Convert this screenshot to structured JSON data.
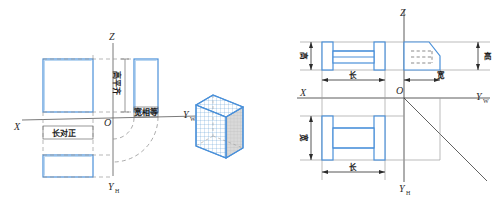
{
  "figure": {
    "colors": {
      "outline_blue": "#4a90d9",
      "axis_gray": "#6b6b6b",
      "dash_gray": "#808080",
      "text_dark": "#1a1a1a",
      "face_shade": "#cfcfcf",
      "grid_blue": "#5b9bd5"
    }
  },
  "left_panel": {
    "name": "projection-rules-diagram",
    "axes": {
      "z": "Z",
      "x": "X",
      "origin": "O",
      "yw_main": "Y",
      "yw_sub": "W",
      "yh_main": "Y",
      "yh_sub": "H"
    },
    "rules": {
      "length": "长对正",
      "height": "高平齐",
      "width": "宽相等"
    },
    "views": {
      "front": "主视图",
      "top": "俯视图",
      "side": "左视图"
    }
  },
  "center_panel": {
    "name": "isometric-solid",
    "label": "立体图"
  },
  "right_panel": {
    "name": "three-view-layout-diagram",
    "axes": {
      "z": "Z",
      "x": "X",
      "origin": "O",
      "yw_main": "Y",
      "yw_sub": "W",
      "yh_main": "Y",
      "yh_sub": "H"
    },
    "dimensions": {
      "front_height": "高",
      "front_length": "长",
      "side_height": "高",
      "side_width": "宽",
      "top_width": "宽",
      "top_length": "长"
    }
  }
}
